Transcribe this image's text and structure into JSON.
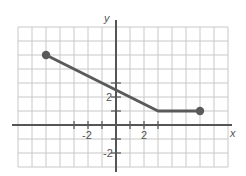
{
  "chart_data": {
    "type": "line",
    "title": "",
    "xlabel": "x",
    "ylabel": "y",
    "xlim": [
      -7,
      8
    ],
    "ylim": [
      -3,
      7
    ],
    "grid": true,
    "grid_step": 1,
    "x_tick_marks": [
      -3,
      -2,
      -1,
      1,
      2,
      3
    ],
    "y_tick_marks": [
      -2,
      -1,
      1,
      2,
      3
    ],
    "x_tick_labels": [
      {
        "value": -2,
        "text": "-2"
      },
      {
        "value": 2,
        "text": "2"
      }
    ],
    "y_tick_labels": [
      {
        "value": 2,
        "text": "2"
      },
      {
        "value": -2,
        "text": "-2"
      }
    ],
    "series": [
      {
        "name": "piecewise",
        "points": [
          [
            -5,
            5
          ],
          [
            3,
            1
          ],
          [
            6,
            1
          ]
        ],
        "closed_endpoints": [
          [
            -5,
            5
          ],
          [
            6,
            1
          ]
        ],
        "color": "#5a5a5a"
      }
    ],
    "legend": null
  }
}
